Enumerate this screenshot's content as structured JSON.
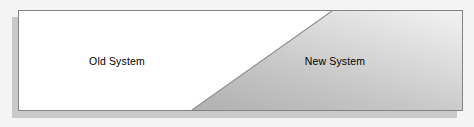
{
  "diagram": {
    "canvas": {
      "width": 474,
      "height": 127,
      "background_color": "#f4f4f4"
    },
    "panel": {
      "border_color": "#848484",
      "fill_color": "#ffffff",
      "shadow_color": "#c9c9c9"
    },
    "regions": [
      {
        "id": "old-system",
        "label": "Old System",
        "fill_color": "#ffffff",
        "text_color": "#000000"
      },
      {
        "id": "new-system",
        "label": "New System",
        "fill_color": "#c4c4c4",
        "fill_color_light": "#ececec",
        "text_color": "#000000"
      }
    ],
    "divider": {
      "id": "diagonal-divider",
      "kind": "diagonal",
      "color": "#8d8d8d",
      "from_x_ratio": 0.391,
      "to_x_ratio": 0.706
    }
  }
}
